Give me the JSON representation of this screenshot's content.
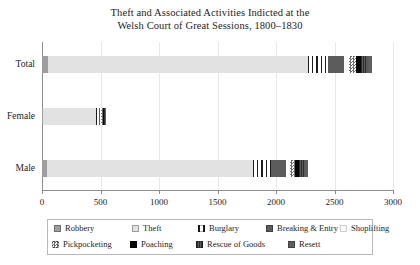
{
  "chart_data": {
    "type": "bar",
    "orientation": "horizontal",
    "stacked": true,
    "title": "Theft and Associated Activities Indicted at the Welsh Court of Great Sessions, 1800–1830",
    "title_lines": [
      "Theft and Associated Activities Indicted at the",
      "Welsh Court of Great Sessions, 1800–1830"
    ],
    "xlabel": "",
    "ylabel": "",
    "categories": [
      "Total",
      "Female",
      "Male"
    ],
    "xlim": [
      0,
      3000
    ],
    "xticks": [
      0,
      500,
      1000,
      1500,
      2000,
      2500,
      3000
    ],
    "xtick_labels": [
      "0",
      "500",
      "1000",
      "1500",
      "2000",
      "2500",
      "3000"
    ],
    "grid": true,
    "legend_position": "bottom",
    "series": [
      {
        "name": "Robbery",
        "values": [
          55,
          10,
          45
        ]
      },
      {
        "name": "Theft",
        "values": [
          2215,
          455,
          1760
        ]
      },
      {
        "name": "Burglary",
        "values": [
          175,
          20,
          155
        ]
      },
      {
        "name": "Breaking & Entry",
        "values": [
          140,
          12,
          128
        ]
      },
      {
        "name": "Shoplifting",
        "values": [
          40,
          10,
          30
        ]
      },
      {
        "name": "Pickpocketing",
        "values": [
          60,
          18,
          42
        ]
      },
      {
        "name": "Poaching",
        "values": [
          45,
          5,
          40
        ]
      },
      {
        "name": "Rescue of Goods",
        "values": [
          60,
          8,
          52
        ]
      },
      {
        "name": "Resett",
        "values": [
          30,
          5,
          25
        ]
      }
    ],
    "totals": [
      2820,
      543,
      2277
    ]
  },
  "legend": {
    "rows": [
      [
        {
          "label": "Robbery",
          "swatch": "f-robbery"
        },
        {
          "label": "Theft",
          "swatch": "f-theft"
        },
        {
          "label": "Burglary",
          "swatch": "f-burglary"
        },
        {
          "label": "Breaking & Entry",
          "swatch": "f-bande"
        },
        {
          "label": "Shoplifting",
          "swatch": "f-shop"
        }
      ],
      [
        {
          "label": "Pickpocketing",
          "swatch": "f-pickpocket"
        },
        {
          "label": "Poaching",
          "swatch": "f-poaching"
        },
        {
          "label": "Rescue of Goods",
          "swatch": "f-rescue"
        },
        {
          "label": "Resett",
          "swatch": "f-resett"
        }
      ]
    ]
  },
  "colors": {
    "robbery": "#9e9e9e",
    "theft": "#e2e2e2",
    "breaking_entry": "#5c5c5c",
    "shoplifting": "#fdfdfd",
    "poaching": "#070707",
    "resett": "#5f5f5f",
    "axis": "#8d8d8d",
    "grid": "#e9e9e9",
    "text": "#1d1d1d",
    "background": "#ffffff"
  }
}
